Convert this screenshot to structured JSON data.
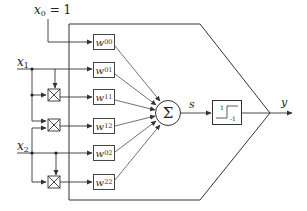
{
  "diagram": {
    "type": "polynomial-neuron-block-diagram",
    "inputs": {
      "bias": {
        "var": "x",
        "sub": "0",
        "eq": "= 1"
      },
      "x1": {
        "var": "x",
        "sub": "1"
      },
      "x2": {
        "var": "x",
        "sub": "2"
      }
    },
    "weights": [
      {
        "var": "w",
        "sub": "00"
      },
      {
        "var": "w",
        "sub": "01"
      },
      {
        "var": "w",
        "sub": "11"
      },
      {
        "var": "w",
        "sub": "12"
      },
      {
        "var": "w",
        "sub": "02"
      },
      {
        "var": "w",
        "sub": "22"
      }
    ],
    "summation": {
      "symbol": "Σ"
    },
    "sum_output": {
      "var": "s"
    },
    "activation": {
      "type": "sign-step",
      "upper": "1",
      "lower": "-1"
    },
    "output": {
      "var": "y"
    },
    "multipliers": [
      {
        "inputs": [
          "x1",
          "x1"
        ],
        "feeds": "w11"
      },
      {
        "inputs": [
          "x1",
          "x2"
        ],
        "feeds": "w12"
      },
      {
        "inputs": [
          "x2",
          "x2"
        ],
        "feeds": "w22"
      }
    ],
    "colors": {
      "line": "#333333",
      "background": "#ffffff"
    }
  }
}
